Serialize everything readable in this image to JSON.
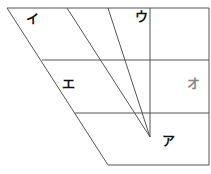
{
  "diagram": {
    "type": "vowel-chart",
    "labels": {
      "i": "イ",
      "u": "ウ",
      "e": "エ",
      "o": "オ",
      "a": "ア"
    },
    "colors": {
      "line": "#555555",
      "text": "#111111",
      "o_text": "#888888"
    }
  }
}
